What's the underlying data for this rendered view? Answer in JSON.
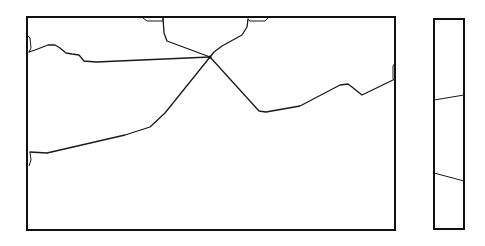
{
  "map": {
    "main_panel": {
      "frame": {
        "x": 27,
        "y": 17,
        "width": 368,
        "height": 213
      },
      "junction": {
        "x": 210,
        "y": 57
      },
      "boundaries": [
        {
          "name": "top-left-to-junction",
          "points": "163,18 164,33 167,41 210,57"
        },
        {
          "name": "top-right-to-junction",
          "points": "248,19 247,27 242,35 222,46 214,52 210,57"
        },
        {
          "name": "west-to-junction",
          "points": "29,52 35,50 48,45 55,45 60,48 66,53 72,54 79,55 84,61 96,62 210,57"
        },
        {
          "name": "junction-to-southwest",
          "points": "210,57 165,113 150,127 125,135 47,153 30,152"
        },
        {
          "name": "junction-to-southeast",
          "points": "210,57 259,111 266,112 300,106 340,85 348,84 352,87 362,95 395,79"
        }
      ],
      "edge_slivers": [
        {
          "name": "top-sliver-left",
          "points": "143,18 147,21 163,21 163,18"
        },
        {
          "name": "top-sliver-right",
          "points": "248,19 250,21 265,21 268,18"
        },
        {
          "name": "west-sliver-top",
          "points": "28,36 30,38 31,48 29,52"
        },
        {
          "name": "west-sliver-bottom",
          "points": "30,152 31,160 29,166"
        },
        {
          "name": "east-sliver",
          "points": "395,63 393,66 393,79"
        }
      ]
    },
    "side_panel": {
      "frame": {
        "x": 434,
        "y": 19,
        "width": 30,
        "height": 210
      },
      "boundaries": [
        {
          "name": "side-upper-line",
          "points": "434,100 464,95"
        },
        {
          "name": "side-lower-line",
          "points": "434,173 464,181"
        }
      ]
    }
  }
}
